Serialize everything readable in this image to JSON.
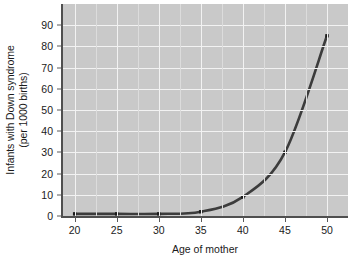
{
  "chart_data": {
    "type": "line",
    "title": "",
    "subtitle": "",
    "xlabel": "Age of mother",
    "ylabel_line1": "Infants with Down syndrome",
    "ylabel_line2": "(per 1000 births)",
    "x": [
      20,
      25,
      30,
      35,
      40,
      45,
      50
    ],
    "values": [
      1,
      1,
      1,
      2,
      9,
      30,
      85
    ],
    "series": [
      {
        "name": "Infants with Down syndrome per 1000 births",
        "values": [
          1,
          1,
          1,
          2,
          9,
          30,
          85
        ]
      }
    ],
    "xlim": [
      18.5,
      52.5
    ],
    "ylim": [
      0,
      100
    ],
    "xticks": [
      20,
      25,
      30,
      35,
      40,
      45,
      50
    ],
    "xtick_labels": [
      "20",
      "25",
      "30",
      "35",
      "40",
      "45",
      "50"
    ],
    "yticks": [
      0,
      10,
      20,
      30,
      40,
      50,
      60,
      70,
      80,
      90
    ],
    "ytick_labels": [
      "0",
      "10",
      "20",
      "30",
      "40",
      "50",
      "60",
      "70",
      "80",
      "90"
    ],
    "grid": true,
    "grid_color": "#f2f2f2",
    "minor_grid_color": "#dcdcdc",
    "plot_background": "#c9c9c9",
    "figure_background": "#ffffff",
    "line_color": "#3c3c3c",
    "marker_color": "#1a1a1a",
    "marker_style": "square",
    "legend": null,
    "legend_position": "none",
    "annotations": []
  }
}
